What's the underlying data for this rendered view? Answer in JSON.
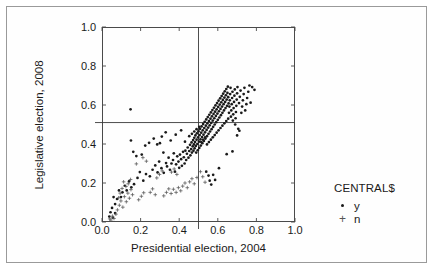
{
  "chart_data": {
    "type": "scatter",
    "title": "",
    "xlabel": "Presidential election, 2004",
    "ylabel": "Legislative election, 2008",
    "xlim": [
      0.0,
      1.0
    ],
    "ylim": [
      0.0,
      1.0
    ],
    "xticks": [
      "0.0",
      "0.2",
      "0.4",
      "0.6",
      "0.8",
      "1.0"
    ],
    "ytricks_note": "",
    "yticks": [
      "0.0",
      "0.2",
      "0.4",
      "0.6",
      "0.8",
      "1.0"
    ],
    "xtick_values": [
      0.0,
      0.2,
      0.4,
      0.6,
      0.8,
      1.0
    ],
    "ytick_values": [
      0.0,
      0.2,
      0.4,
      0.6,
      0.8,
      1.0
    ],
    "grid": false,
    "legend_position": "right",
    "legend_title": "CENTRAL$",
    "reference_lines": [
      {
        "orientation": "vertical",
        "value": 0.5
      },
      {
        "orientation": "horizontal",
        "value": 0.51
      }
    ],
    "series": [
      {
        "name": "y",
        "marker": "dot",
        "color": "#1a1a1a",
        "points": [
          [
            0.148,
            0.578
          ],
          [
            0.3,
            0.404
          ],
          [
            0.318,
            0.356
          ],
          [
            0.337,
            0.285
          ],
          [
            0.345,
            0.33
          ],
          [
            0.352,
            0.268
          ],
          [
            0.36,
            0.3
          ],
          [
            0.368,
            0.318
          ],
          [
            0.372,
            0.352
          ],
          [
            0.378,
            0.258
          ],
          [
            0.384,
            0.296
          ],
          [
            0.39,
            0.337
          ],
          [
            0.396,
            0.31
          ],
          [
            0.4,
            0.278
          ],
          [
            0.404,
            0.346
          ],
          [
            0.41,
            0.322
          ],
          [
            0.414,
            0.288
          ],
          [
            0.42,
            0.36
          ],
          [
            0.424,
            0.332
          ],
          [
            0.428,
            0.3
          ],
          [
            0.432,
            0.366
          ],
          [
            0.436,
            0.318
          ],
          [
            0.44,
            0.35
          ],
          [
            0.444,
            0.382
          ],
          [
            0.448,
            0.33
          ],
          [
            0.452,
            0.364
          ],
          [
            0.456,
            0.396
          ],
          [
            0.458,
            0.342
          ],
          [
            0.462,
            0.374
          ],
          [
            0.464,
            0.408
          ],
          [
            0.466,
            0.356
          ],
          [
            0.47,
            0.388
          ],
          [
            0.472,
            0.42
          ],
          [
            0.474,
            0.366
          ],
          [
            0.476,
            0.398
          ],
          [
            0.478,
            0.432
          ],
          [
            0.48,
            0.378
          ],
          [
            0.482,
            0.41
          ],
          [
            0.484,
            0.444
          ],
          [
            0.486,
            0.39
          ],
          [
            0.488,
            0.356
          ],
          [
            0.49,
            0.422
          ],
          [
            0.492,
            0.455
          ],
          [
            0.494,
            0.4
          ],
          [
            0.496,
            0.368
          ],
          [
            0.498,
            0.434
          ],
          [
            0.5,
            0.466
          ],
          [
            0.502,
            0.412
          ],
          [
            0.504,
            0.38
          ],
          [
            0.506,
            0.446
          ],
          [
            0.508,
            0.478
          ],
          [
            0.51,
            0.424
          ],
          [
            0.512,
            0.392
          ],
          [
            0.514,
            0.458
          ],
          [
            0.516,
            0.49
          ],
          [
            0.518,
            0.436
          ],
          [
            0.52,
            0.404
          ],
          [
            0.522,
            0.47
          ],
          [
            0.524,
            0.502
          ],
          [
            0.526,
            0.448
          ],
          [
            0.528,
            0.416
          ],
          [
            0.53,
            0.482
          ],
          [
            0.532,
            0.514
          ],
          [
            0.534,
            0.46
          ],
          [
            0.536,
            0.428
          ],
          [
            0.538,
            0.494
          ],
          [
            0.54,
            0.526
          ],
          [
            0.542,
            0.472
          ],
          [
            0.544,
            0.44
          ],
          [
            0.546,
            0.506
          ],
          [
            0.548,
            0.538
          ],
          [
            0.55,
            0.484
          ],
          [
            0.552,
            0.452
          ],
          [
            0.554,
            0.518
          ],
          [
            0.556,
            0.55
          ],
          [
            0.558,
            0.496
          ],
          [
            0.56,
            0.464
          ],
          [
            0.562,
            0.53
          ],
          [
            0.564,
            0.562
          ],
          [
            0.566,
            0.508
          ],
          [
            0.568,
            0.476
          ],
          [
            0.57,
            0.542
          ],
          [
            0.572,
            0.574
          ],
          [
            0.574,
            0.52
          ],
          [
            0.576,
            0.488
          ],
          [
            0.578,
            0.554
          ],
          [
            0.58,
            0.586
          ],
          [
            0.582,
            0.532
          ],
          [
            0.584,
            0.5
          ],
          [
            0.586,
            0.566
          ],
          [
            0.588,
            0.598
          ],
          [
            0.59,
            0.544
          ],
          [
            0.592,
            0.512
          ],
          [
            0.594,
            0.578
          ],
          [
            0.596,
            0.61
          ],
          [
            0.598,
            0.556
          ],
          [
            0.6,
            0.524
          ],
          [
            0.602,
            0.59
          ],
          [
            0.604,
            0.622
          ],
          [
            0.606,
            0.568
          ],
          [
            0.608,
            0.536
          ],
          [
            0.61,
            0.602
          ],
          [
            0.612,
            0.634
          ],
          [
            0.614,
            0.58
          ],
          [
            0.616,
            0.548
          ],
          [
            0.618,
            0.614
          ],
          [
            0.62,
            0.646
          ],
          [
            0.622,
            0.592
          ],
          [
            0.624,
            0.56
          ],
          [
            0.626,
            0.626
          ],
          [
            0.628,
            0.658
          ],
          [
            0.63,
            0.604
          ],
          [
            0.632,
            0.572
          ],
          [
            0.634,
            0.638
          ],
          [
            0.636,
            0.67
          ],
          [
            0.638,
            0.616
          ],
          [
            0.64,
            0.584
          ],
          [
            0.642,
            0.65
          ],
          [
            0.644,
            0.682
          ],
          [
            0.646,
            0.628
          ],
          [
            0.648,
            0.596
          ],
          [
            0.65,
            0.662
          ],
          [
            0.652,
            0.694
          ],
          [
            0.654,
            0.64
          ],
          [
            0.656,
            0.608
          ],
          [
            0.658,
            0.56
          ],
          [
            0.66,
            0.592
          ],
          [
            0.662,
            0.624
          ],
          [
            0.664,
            0.656
          ],
          [
            0.666,
            0.688
          ],
          [
            0.668,
            0.54
          ],
          [
            0.67,
            0.572
          ],
          [
            0.672,
            0.604
          ],
          [
            0.674,
            0.636
          ],
          [
            0.676,
            0.668
          ],
          [
            0.678,
            0.52
          ],
          [
            0.68,
            0.552
          ],
          [
            0.682,
            0.584
          ],
          [
            0.684,
            0.616
          ],
          [
            0.686,
            0.648
          ],
          [
            0.688,
            0.68
          ],
          [
            0.69,
            0.5
          ],
          [
            0.692,
            0.532
          ],
          [
            0.694,
            0.564
          ],
          [
            0.696,
            0.596
          ],
          [
            0.698,
            0.628
          ],
          [
            0.7,
            0.66
          ],
          [
            0.702,
            0.692
          ],
          [
            0.706,
            0.478
          ],
          [
            0.71,
            0.61
          ],
          [
            0.714,
            0.642
          ],
          [
            0.718,
            0.674
          ],
          [
            0.722,
            0.56
          ],
          [
            0.726,
            0.592
          ],
          [
            0.73,
            0.624
          ],
          [
            0.734,
            0.656
          ],
          [
            0.738,
            0.688
          ],
          [
            0.742,
            0.572
          ],
          [
            0.748,
            0.604
          ],
          [
            0.752,
            0.636
          ],
          [
            0.758,
            0.668
          ],
          [
            0.764,
            0.7
          ],
          [
            0.77,
            0.612
          ],
          [
            0.778,
            0.692
          ],
          [
            0.79,
            0.678
          ],
          [
            0.452,
            0.44
          ],
          [
            0.466,
            0.452
          ],
          [
            0.478,
            0.464
          ],
          [
            0.49,
            0.476
          ],
          [
            0.504,
            0.488
          ],
          [
            0.514,
            0.41
          ],
          [
            0.524,
            0.422
          ],
          [
            0.534,
            0.434
          ],
          [
            0.544,
            0.398
          ],
          [
            0.554,
            0.41
          ],
          [
            0.564,
            0.422
          ],
          [
            0.574,
            0.434
          ],
          [
            0.584,
            0.446
          ],
          [
            0.594,
            0.458
          ],
          [
            0.604,
            0.47
          ],
          [
            0.614,
            0.482
          ],
          [
            0.624,
            0.494
          ],
          [
            0.634,
            0.506
          ],
          [
            0.644,
            0.518
          ],
          [
            0.654,
            0.53
          ],
          [
            0.54,
            0.258
          ],
          [
            0.552,
            0.238
          ],
          [
            0.558,
            0.212
          ],
          [
            0.566,
            0.192
          ],
          [
            0.576,
            0.242
          ],
          [
            0.586,
            0.216
          ],
          [
            0.606,
            0.276
          ],
          [
            0.646,
            0.348
          ],
          [
            0.676,
            0.362
          ],
          [
            0.7,
            0.444
          ],
          [
            0.712,
            0.468
          ],
          [
            0.248,
            0.234
          ],
          [
            0.262,
            0.268
          ],
          [
            0.276,
            0.29
          ],
          [
            0.288,
            0.254
          ],
          [
            0.296,
            0.31
          ],
          [
            0.308,
            0.276
          ],
          [
            0.32,
            0.252
          ],
          [
            0.332,
            0.302
          ],
          [
            0.214,
            0.212
          ],
          [
            0.228,
            0.246
          ],
          [
            0.196,
            0.256
          ],
          [
            0.184,
            0.226
          ],
          [
            0.166,
            0.194
          ],
          [
            0.152,
            0.178
          ],
          [
            0.14,
            0.208
          ],
          [
            0.128,
            0.162
          ],
          [
            0.118,
            0.186
          ],
          [
            0.106,
            0.152
          ],
          [
            0.098,
            0.128
          ],
          [
            0.088,
            0.162
          ],
          [
            0.078,
            0.118
          ],
          [
            0.068,
            0.092
          ],
          [
            0.06,
            0.128
          ],
          [
            0.052,
            0.072
          ],
          [
            0.044,
            0.05
          ],
          [
            0.038,
            0.028
          ],
          [
            0.056,
            0.022
          ],
          [
            0.068,
            0.046
          ],
          [
            0.15,
            0.418
          ],
          [
            0.162,
            0.36
          ],
          [
            0.178,
            0.338
          ],
          [
            0.206,
            0.346
          ],
          [
            0.224,
            0.392
          ],
          [
            0.244,
            0.406
          ],
          [
            0.268,
            0.428
          ],
          [
            0.286,
            0.398
          ],
          [
            0.31,
            0.438
          ],
          [
            0.33,
            0.46
          ],
          [
            0.356,
            0.418
          ],
          [
            0.382,
            0.448
          ],
          [
            0.41,
            0.47
          ],
          [
            0.43,
            0.412
          ]
        ]
      },
      {
        "name": "n",
        "marker": "plus",
        "color": "#555555",
        "points": [
          [
            0.062,
            0.018
          ],
          [
            0.072,
            0.04
          ],
          [
            0.08,
            0.062
          ],
          [
            0.09,
            0.086
          ],
          [
            0.098,
            0.108
          ],
          [
            0.108,
            0.076
          ],
          [
            0.116,
            0.13
          ],
          [
            0.126,
            0.104
          ],
          [
            0.134,
            0.148
          ],
          [
            0.142,
            0.122
          ],
          [
            0.15,
            0.166
          ],
          [
            0.158,
            0.14
          ],
          [
            0.124,
            0.182
          ],
          [
            0.136,
            0.196
          ],
          [
            0.112,
            0.206
          ],
          [
            0.148,
            0.218
          ],
          [
            0.104,
            0.172
          ],
          [
            0.094,
            0.148
          ],
          [
            0.086,
            0.124
          ],
          [
            0.19,
            0.114
          ],
          [
            0.204,
            0.132
          ],
          [
            0.216,
            0.15
          ],
          [
            0.25,
            0.152
          ],
          [
            0.262,
            0.17
          ],
          [
            0.276,
            0.14
          ],
          [
            0.32,
            0.134
          ],
          [
            0.334,
            0.152
          ],
          [
            0.346,
            0.17
          ],
          [
            0.358,
            0.146
          ],
          [
            0.37,
            0.168
          ],
          [
            0.384,
            0.152
          ],
          [
            0.396,
            0.176
          ],
          [
            0.408,
            0.16
          ],
          [
            0.418,
            0.184
          ],
          [
            0.43,
            0.2
          ],
          [
            0.442,
            0.176
          ],
          [
            0.454,
            0.206
          ],
          [
            0.466,
            0.222
          ],
          [
            0.478,
            0.196
          ],
          [
            0.492,
            0.228
          ],
          [
            0.298,
            0.244
          ],
          [
            0.312,
            0.262
          ],
          [
            0.284,
            0.226
          ],
          [
            0.36,
            0.256
          ],
          [
            0.374,
            0.272
          ],
          [
            0.388,
            0.244
          ],
          [
            0.046,
            0.01
          ],
          [
            0.054,
            0.03
          ],
          [
            0.04,
            0.016
          ],
          [
            0.212,
            0.33
          ],
          [
            0.23,
            0.312
          ],
          [
            0.178,
            0.298
          ],
          [
            0.51,
            0.258
          ],
          [
            0.522,
            0.232
          ],
          [
            0.534,
            0.204
          ]
        ]
      }
    ]
  },
  "legend": {
    "title": "CENTRAL$",
    "entries": [
      {
        "label": "y",
        "marker": "dot"
      },
      {
        "label": "n",
        "marker": "plus"
      }
    ]
  }
}
